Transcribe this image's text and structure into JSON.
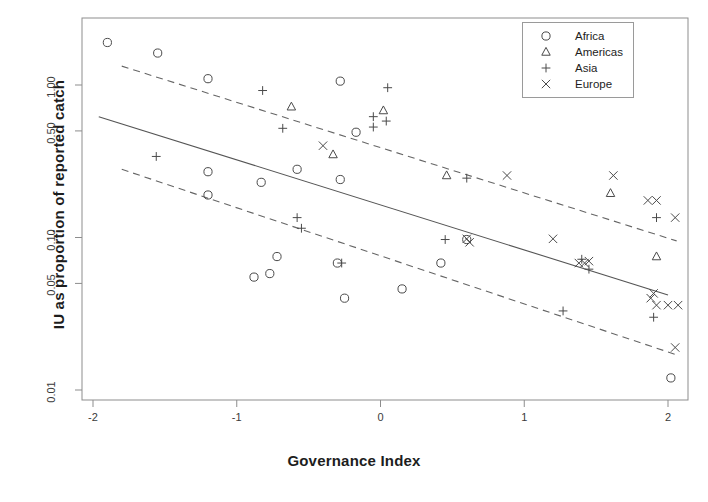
{
  "chart_data": {
    "type": "scatter",
    "title": "",
    "xlabel": "Governance Index",
    "ylabel": "IU as proportion of reported catch",
    "xlim": [
      -2.2,
      2.2
    ],
    "ylim": [
      0.009,
      2.2
    ],
    "yscale": "log",
    "grid": false,
    "legend_position": "top-right",
    "xticks": [
      -2,
      -1,
      0,
      1,
      2
    ],
    "xtick_labels": [
      "-2",
      "-1",
      "0",
      "1",
      "2"
    ],
    "yticks": [
      1.0,
      0.5,
      0.1,
      0.05,
      0.01
    ],
    "ytick_labels": [
      "1.00",
      "0.50",
      "0.10",
      "0.05",
      "0.01"
    ],
    "legend": [
      {
        "label": "Africa",
        "marker": "circle-marker"
      },
      {
        "label": "Americas",
        "marker": "triangle-marker"
      },
      {
        "label": "Asia",
        "marker": "plus-marker"
      },
      {
        "label": "Europe",
        "marker": "cross-marker"
      }
    ],
    "series": [
      {
        "name": "Africa",
        "marker": "circle-marker",
        "points": [
          [
            -1.9,
            1.9
          ],
          [
            -1.55,
            1.62
          ],
          [
            -1.2,
            1.1
          ],
          [
            -0.28,
            1.06
          ],
          [
            -0.17,
            0.49
          ],
          [
            -1.2,
            0.27
          ],
          [
            -1.2,
            0.19
          ],
          [
            -0.83,
            0.23
          ],
          [
            -0.58,
            0.28
          ],
          [
            -0.28,
            0.24
          ],
          [
            -0.88,
            0.055
          ],
          [
            -0.77,
            0.058
          ],
          [
            -0.72,
            0.075
          ],
          [
            -0.3,
            0.068
          ],
          [
            -0.25,
            0.04
          ],
          [
            0.15,
            0.046
          ],
          [
            0.42,
            0.068
          ],
          [
            0.6,
            0.097
          ],
          [
            2.02,
            0.012
          ]
        ]
      },
      {
        "name": "Americas",
        "marker": "triangle-marker",
        "points": [
          [
            -0.62,
            0.72
          ],
          [
            0.02,
            0.68
          ],
          [
            -0.33,
            0.35
          ],
          [
            0.46,
            0.255
          ],
          [
            1.6,
            0.195
          ],
          [
            1.92,
            0.075
          ]
        ]
      },
      {
        "name": "Asia",
        "marker": "plus-marker",
        "points": [
          [
            -1.56,
            0.34
          ],
          [
            -0.82,
            0.92
          ],
          [
            -0.68,
            0.52
          ],
          [
            -0.05,
            0.62
          ],
          [
            -0.05,
            0.53
          ],
          [
            0.04,
            0.58
          ],
          [
            0.05,
            0.96
          ],
          [
            0.6,
            0.245
          ],
          [
            -0.58,
            0.135
          ],
          [
            -0.55,
            0.115
          ],
          [
            -0.27,
            0.068
          ],
          [
            0.45,
            0.097
          ],
          [
            1.27,
            0.033
          ],
          [
            1.4,
            0.072
          ],
          [
            1.92,
            0.135
          ],
          [
            1.9,
            0.03
          ],
          [
            1.45,
            0.062
          ]
        ]
      },
      {
        "name": "Europe",
        "marker": "cross-marker",
        "points": [
          [
            -0.4,
            0.4
          ],
          [
            0.6,
            0.098
          ],
          [
            0.62,
            0.093
          ],
          [
            0.88,
            0.255
          ],
          [
            1.2,
            0.098
          ],
          [
            1.38,
            0.068
          ],
          [
            1.42,
            0.068
          ],
          [
            1.45,
            0.07
          ],
          [
            1.62,
            0.255
          ],
          [
            1.86,
            0.175
          ],
          [
            1.92,
            0.175
          ],
          [
            2.05,
            0.135
          ],
          [
            1.88,
            0.04
          ],
          [
            1.92,
            0.036
          ],
          [
            2.0,
            0.036
          ],
          [
            2.07,
            0.036
          ],
          [
            2.05,
            0.019
          ],
          [
            1.9,
            0.043
          ]
        ]
      }
    ],
    "fit_line": {
      "name": "regression-line",
      "style": "solid",
      "endpoints": [
        [
          -1.96,
          0.62
        ],
        [
          2.0,
          0.042
        ]
      ]
    },
    "confidence_bands": [
      {
        "name": "upper-confidence-band",
        "style": "dashed",
        "endpoints": [
          [
            -1.8,
            1.33
          ],
          [
            2.06,
            0.095
          ]
        ]
      },
      {
        "name": "lower-confidence-band",
        "style": "dashed",
        "endpoints": [
          [
            -1.8,
            0.28
          ],
          [
            2.06,
            0.017
          ]
        ]
      }
    ]
  }
}
